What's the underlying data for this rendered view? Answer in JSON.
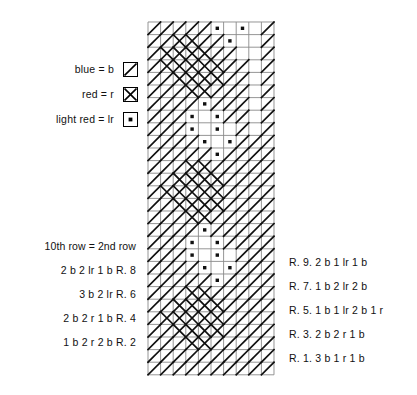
{
  "legend": {
    "items": [
      {
        "label": "blue = b",
        "symbol": "diagonal-line-symbol"
      },
      {
        "label": "red = r",
        "symbol": "cross-symbol"
      },
      {
        "label": "light red = lr",
        "symbol": "dot-symbol"
      }
    ]
  },
  "left_rows": {
    "lines": [
      "10th row = 2nd row",
      "2 b  2 lr  1 b     R. 8",
      "3 b  2 lr     R. 6",
      "2 b  2 r  1 b     R. 4",
      "1 b  2 r  2 b     R. 2"
    ]
  },
  "right_rows": {
    "lines": [
      "R. 9.   2 b  1 lr  1 b",
      "R. 7.   1 b  2 lr  2 b",
      "R. 5.   1 b  1 lr  2 b  1 r",
      "R. 3.   2 b  2 r  1 b",
      "R. 1.   3 b  1 r  1 b"
    ]
  },
  "chart_data": {
    "type": "heatmap",
    "title": "",
    "xlabel": "",
    "ylabel": "",
    "columns": 10,
    "rows": 28,
    "cell_px": 12.6,
    "grid": true,
    "symbol_key": {
      "b": "diagonal-line",
      "r": "cross",
      "lr": "dot",
      ".": "empty"
    },
    "legend_position": "left",
    "colors": {
      "ink": "#111111",
      "grid": "#8a8a8a",
      "background": "#ffffff"
    },
    "cells": [
      [
        "b",
        "b",
        "b",
        "b",
        "b",
        "lr",
        ".",
        "lr",
        ".",
        "b"
      ],
      [
        "b",
        "b",
        "r",
        "r",
        "b",
        "b",
        "lr",
        ".",
        ".",
        "b"
      ],
      [
        "b",
        "r",
        "r",
        "r",
        "r",
        "b",
        "b",
        ".",
        ".",
        "b"
      ],
      [
        "b",
        "r",
        "r",
        "r",
        "r",
        "r",
        "b",
        "b",
        ".",
        "b"
      ],
      [
        "b",
        "b",
        "r",
        "r",
        "r",
        "r",
        "b",
        "b",
        ".",
        "b"
      ],
      [
        "b",
        "b",
        "b",
        "r",
        "r",
        "b",
        "b",
        "b",
        ".",
        "b"
      ],
      [
        "b",
        "b",
        "b",
        "b",
        "lr",
        "b",
        "b",
        "b",
        ".",
        "b"
      ],
      [
        "b",
        "b",
        "b",
        "lr",
        ".",
        "lr",
        "b",
        "b",
        ".",
        "b"
      ],
      [
        "b",
        "b",
        "b",
        "lr",
        ".",
        "lr",
        ".",
        "b",
        ".",
        "b"
      ],
      [
        "b",
        "b",
        "b",
        "b",
        "lr",
        ".",
        "lr",
        "b",
        "b",
        "b"
      ],
      [
        "b",
        "b",
        "b",
        "b",
        "b",
        "lr",
        "b",
        "b",
        "b",
        "b"
      ],
      [
        "b",
        "b",
        "b",
        "r",
        "r",
        "b",
        "b",
        "b",
        "b",
        "b"
      ],
      [
        "b",
        "b",
        "r",
        "r",
        "r",
        "r",
        "b",
        "b",
        "b",
        "b"
      ],
      [
        "b",
        "r",
        "r",
        "r",
        "r",
        "r",
        "b",
        "b",
        "b",
        "b"
      ],
      [
        "b",
        "b",
        "r",
        "r",
        "r",
        "r",
        "b",
        "b",
        "b",
        "b"
      ],
      [
        "b",
        "b",
        "b",
        "r",
        "r",
        "b",
        "b",
        "b",
        "b",
        "b"
      ],
      [
        "b",
        "b",
        "b",
        "b",
        "lr",
        "b",
        "b",
        "b",
        "b",
        "b"
      ],
      [
        "b",
        "b",
        "b",
        "lr",
        ".",
        "lr",
        "b",
        "b",
        "b",
        "b"
      ],
      [
        "b",
        "b",
        "b",
        "lr",
        ".",
        "lr",
        ".",
        "b",
        "b",
        "b"
      ],
      [
        "b",
        "b",
        "b",
        "b",
        "lr",
        ".",
        "lr",
        "b",
        "b",
        "b"
      ],
      [
        "b",
        "b",
        "b",
        "b",
        "b",
        "lr",
        "b",
        "b",
        "b",
        "b"
      ],
      [
        "b",
        "b",
        "b",
        "r",
        "r",
        "b",
        "b",
        "b",
        "b",
        "b"
      ],
      [
        "b",
        "b",
        "r",
        "r",
        "r",
        "r",
        "b",
        "b",
        "b",
        "b"
      ],
      [
        "b",
        "r",
        "r",
        "r",
        "r",
        "r",
        "b",
        "b",
        "b",
        "b"
      ],
      [
        "b",
        "b",
        "r",
        "r",
        "r",
        "r",
        "b",
        "b",
        "b",
        "b"
      ],
      [
        "b",
        "b",
        "b",
        "r",
        "r",
        "b",
        "b",
        "b",
        "b",
        "b"
      ],
      [
        "b",
        "b",
        "b",
        "b",
        "b",
        "b",
        "b",
        "b",
        "b",
        "b"
      ],
      [
        "b",
        "b",
        "b",
        "b",
        "b",
        "b",
        "b",
        "b",
        "b",
        "b"
      ]
    ]
  }
}
